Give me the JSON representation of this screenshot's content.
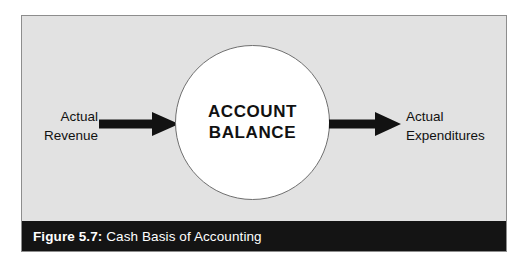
{
  "figure": {
    "center_node": {
      "label": "ACCOUNT\nBALANCE",
      "shape": "circle",
      "fill_color": "#ffffff",
      "stroke_color": "#6f6f6f"
    },
    "inflow": {
      "label": "Actual\nRevenue",
      "arrow_icon": "arrow-right-icon",
      "arrow_color": "#121212"
    },
    "outflow": {
      "label": "Actual\nExpenditures",
      "arrow_icon": "arrow-right-icon",
      "arrow_color": "#121212"
    },
    "caption": {
      "figure_number": "Figure 5.7:",
      "title": " Cash Basis of Accounting",
      "bar_color": "#141414",
      "text_color": "#ffffff"
    },
    "panel": {
      "background_color": "#e2e2e2",
      "border_color": "#8d8d8d"
    }
  }
}
